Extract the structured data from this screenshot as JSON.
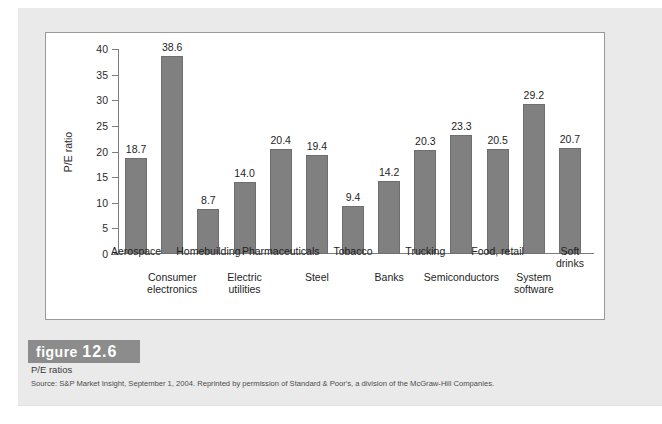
{
  "figure": {
    "badge_word": "figure",
    "number": "12.6",
    "subtitle": "P/E ratios",
    "source": "Source: S&P Market Insight, September 1, 2004. Reprinted by permission of Standard & Poor's, a division of the McGraw-Hill Companies."
  },
  "colors": {
    "bar_fill": "#808080",
    "bar_stroke": "#6e6e6e",
    "axis": "#7d7d7d",
    "badge_bg": "#8c8c8c",
    "page_bg": "#eaeaea",
    "panel_bg": "#ffffff",
    "panel_border": "#9a9a9a"
  },
  "chart_data": {
    "type": "bar",
    "title": "",
    "xlabel": "",
    "ylabel": "P/E ratio",
    "ylim": [
      0,
      40
    ],
    "yticks": [
      0,
      5,
      10,
      15,
      20,
      25,
      30,
      35,
      40
    ],
    "ytick_labels": [
      "0",
      "5",
      "10",
      "15",
      "20",
      "25",
      "30",
      "35",
      "40"
    ],
    "grid": false,
    "legend": false,
    "label_rows": [
      0,
      1,
      0,
      1,
      0,
      1,
      0,
      1,
      0,
      1,
      0,
      1
    ],
    "categories": [
      "Aerospace",
      "Consumer electronics",
      "Homebuilding",
      "Electric utilities",
      "Pharmaceuticals",
      "Steel",
      "Tobacco",
      "Banks",
      "Trucking",
      "Semiconductors",
      "Food, retail",
      "System software",
      "Soft drinks"
    ],
    "bars": [
      {
        "category": "Aerospace",
        "label_lines": [
          "Aerospace"
        ],
        "value": 18.7,
        "value_label": "18.7",
        "label_row": 0
      },
      {
        "category": "Consumer electronics",
        "label_lines": [
          "Consumer",
          "electronics"
        ],
        "value": 38.6,
        "value_label": "38.6",
        "label_row": 1
      },
      {
        "category": "Homebuilding",
        "label_lines": [
          "Homebuilding"
        ],
        "value": 8.7,
        "value_label": "8.7",
        "label_row": 0
      },
      {
        "category": "Electric utilities",
        "label_lines": [
          "Electric",
          "utilities"
        ],
        "value": 14.0,
        "value_label": "14.0",
        "label_row": 1
      },
      {
        "category": "Pharmaceuticals",
        "label_lines": [
          "Pharmaceuticals"
        ],
        "value": 20.4,
        "value_label": "20.4",
        "label_row": 0
      },
      {
        "category": "Steel",
        "label_lines": [
          "Steel"
        ],
        "value": 19.4,
        "value_label": "19.4",
        "label_row": 1
      },
      {
        "category": "Tobacco",
        "label_lines": [
          "Tobacco"
        ],
        "value": 9.4,
        "value_label": "9.4",
        "label_row": 0
      },
      {
        "category": "Banks",
        "label_lines": [
          "Banks"
        ],
        "value": 14.2,
        "value_label": "14.2",
        "label_row": 1
      },
      {
        "category": "Trucking",
        "label_lines": [
          "Trucking"
        ],
        "value": 20.3,
        "value_label": "20.3",
        "label_row": 0
      },
      {
        "category": "Semiconductors",
        "label_lines": [
          "Semiconductors"
        ],
        "value": 23.3,
        "value_label": "23.3",
        "label_row": 1
      },
      {
        "category": "Food, retail",
        "label_lines": [
          "Food, retail"
        ],
        "value": 20.5,
        "value_label": "20.5",
        "label_row": 0
      },
      {
        "category": "System software",
        "label_lines": [
          "System",
          "software"
        ],
        "value": 29.2,
        "value_label": "29.2",
        "label_row": 1
      },
      {
        "category": "Soft drinks",
        "label_lines": [
          "Soft",
          "drinks"
        ],
        "value": 20.7,
        "value_label": "20.7",
        "label_row": 0
      }
    ]
  }
}
